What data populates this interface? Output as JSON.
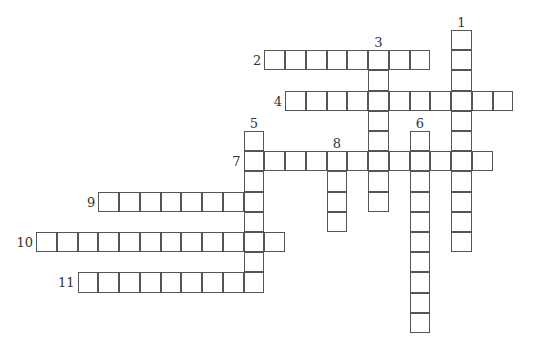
{
  "puzzle": {
    "type": "crossword",
    "grid": {
      "origin_x": 36,
      "origin_y": 30,
      "cell_w": 20.75,
      "cell_h": 20.2
    },
    "colors": {
      "line": "#555555",
      "background": "#ffffff",
      "number": "#333333"
    },
    "entries": [
      {
        "number": "1",
        "direction": "down",
        "col": 20,
        "row": 0,
        "length": 11
      },
      {
        "number": "2",
        "direction": "across",
        "col": 11,
        "row": 1,
        "length": 8
      },
      {
        "number": "3",
        "direction": "down",
        "col": 16,
        "row": 1,
        "length": 8
      },
      {
        "number": "4",
        "direction": "across",
        "col": 12,
        "row": 3,
        "length": 11
      },
      {
        "number": "5",
        "direction": "down",
        "col": 10,
        "row": 5,
        "length": 8
      },
      {
        "number": "6",
        "direction": "down",
        "col": 18,
        "row": 5,
        "length": 10
      },
      {
        "number": "7",
        "direction": "across",
        "col": 10,
        "row": 6,
        "length": 12
      },
      {
        "number": "8",
        "direction": "down",
        "col": 14,
        "row": 6,
        "length": 4
      },
      {
        "number": "9",
        "direction": "across",
        "col": 3,
        "row": 8,
        "length": 8
      },
      {
        "number": "10",
        "direction": "across",
        "col": 0,
        "row": 10,
        "length": 12
      },
      {
        "number": "11",
        "direction": "across",
        "col": 2,
        "row": 12,
        "length": 9
      }
    ]
  }
}
